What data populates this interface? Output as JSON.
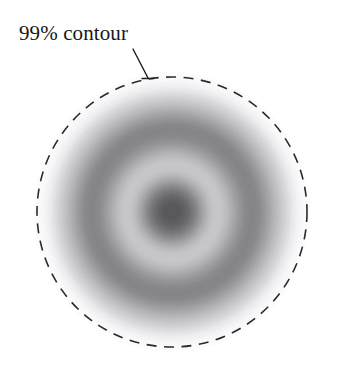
{
  "figure": {
    "width": 340,
    "height": 382,
    "background_color": "#ffffff",
    "annotation": {
      "label": "99% contour",
      "label_x": 19,
      "label_y": 23,
      "font_size": 21,
      "color": "#17171a",
      "leader_line": {
        "x1": 133,
        "y1": 49,
        "x2": 148,
        "y2": 78,
        "tick_half_width": 6,
        "stroke_width": 1.4,
        "color": "#1c1c1f"
      }
    }
  },
  "chart_data": {
    "type": "heatmap",
    "title": "99% contour",
    "subtitle": "",
    "xlabel": "",
    "ylabel": "",
    "grid": false,
    "legend": "none",
    "colormap": "greys-inverted",
    "center": {
      "x": 172,
      "y": 212
    },
    "contour": {
      "name": "99% contour",
      "level": 0.99,
      "shape": "circle",
      "center_x": 172,
      "center_y": 212,
      "radius": 135,
      "stroke_color": "#2a2a2e",
      "stroke_width": 1.6,
      "dash_length": 10,
      "gap_length": 7.5
    },
    "radial_profile": {
      "radius_units": "px",
      "value_units": "normalized density (0 = white, 1 = black)",
      "r": [
        0,
        8,
        16,
        24,
        32,
        40,
        48,
        56,
        64,
        72,
        80,
        88,
        96,
        104,
        112,
        120,
        128,
        136
      ],
      "density": [
        0.8,
        0.79,
        0.72,
        0.58,
        0.4,
        0.27,
        0.25,
        0.33,
        0.45,
        0.55,
        0.58,
        0.55,
        0.46,
        0.35,
        0.24,
        0.13,
        0.05,
        0.0
      ]
    },
    "features": [
      {
        "name": "dark core",
        "r_inner": 0,
        "r_outer": 24,
        "peak_density": 0.8
      },
      {
        "name": "light annulus",
        "r_inner": 36,
        "r_outer": 54,
        "min_density": 0.24
      },
      {
        "name": "dark annulus",
        "r_inner": 64,
        "r_outer": 100,
        "peak_density": 0.58
      },
      {
        "name": "outer fade",
        "r_inner": 100,
        "r_outer": 136,
        "min_density": 0.0
      }
    ],
    "axis_ranges": {
      "xlim": [
        0,
        340
      ],
      "ylim": [
        0,
        382
      ]
    }
  }
}
